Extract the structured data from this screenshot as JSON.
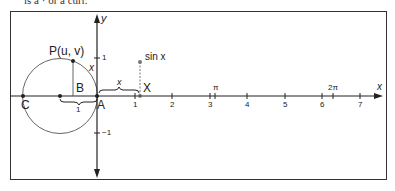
{
  "header_cut_text": "is a · or a curr.",
  "figure": {
    "axis_labels": {
      "x": "x",
      "y": "y"
    },
    "points": {
      "P": "P(u, v)",
      "B": "B",
      "A": "A",
      "C": "C",
      "X": "X"
    },
    "function_label": "sin x",
    "arc_label": "x",
    "brace_x_label": "x",
    "brace_1_label": "1",
    "y_ticks": [
      "1",
      "−1"
    ],
    "x_ticks": [
      "1",
      "2",
      "3",
      "4",
      "5",
      "6",
      "7"
    ],
    "special_ticks": [
      "π",
      "2π"
    ]
  }
}
